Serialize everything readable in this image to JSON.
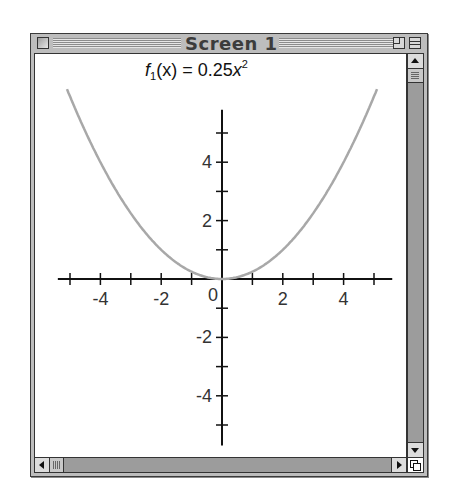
{
  "window": {
    "title": "Screen 1"
  },
  "colors": {
    "curve": "#a8a8a8",
    "axes": "#111111",
    "window_frame": "#bdbdbd",
    "scrollbar_track": "#9c9c9c"
  },
  "chart_data": {
    "type": "line",
    "title_parts": {
      "f": "f",
      "sub": "1",
      "rest": "(x) = 0.25",
      "var": "x",
      "sup": "2"
    },
    "xlabel": "",
    "ylabel": "",
    "xlim": [
      -5.4,
      5.6
    ],
    "ylim": [
      -5.7,
      5.8
    ],
    "grid": false,
    "legend": null,
    "x_ticks": [
      -5,
      -4,
      -3,
      -2,
      -1,
      1,
      2,
      3,
      4,
      5
    ],
    "y_ticks": [
      -5,
      -4,
      -3,
      -2,
      -1,
      1,
      2,
      3,
      4,
      5
    ],
    "x_tick_labels": [
      {
        "value": -4,
        "label": "-4"
      },
      {
        "value": -2,
        "label": "-2"
      },
      {
        "value": 2,
        "label": "2"
      },
      {
        "value": 4,
        "label": "4"
      }
    ],
    "y_tick_labels": [
      {
        "value": 4,
        "label": "4"
      },
      {
        "value": 2,
        "label": "2"
      },
      {
        "value": -2,
        "label": "-2"
      },
      {
        "value": -4,
        "label": "-4"
      }
    ],
    "origin_label": "0",
    "series": [
      {
        "name": "f1",
        "expression": "0.25*x^2",
        "x": [
          -5.1,
          -5,
          -4,
          -3,
          -2,
          -1,
          0,
          1,
          2,
          3,
          4,
          5,
          5.1
        ],
        "values": [
          6.5,
          6.25,
          4,
          2.25,
          1,
          0.25,
          0,
          0.25,
          1,
          2.25,
          4,
          6.25,
          6.5
        ]
      }
    ]
  }
}
